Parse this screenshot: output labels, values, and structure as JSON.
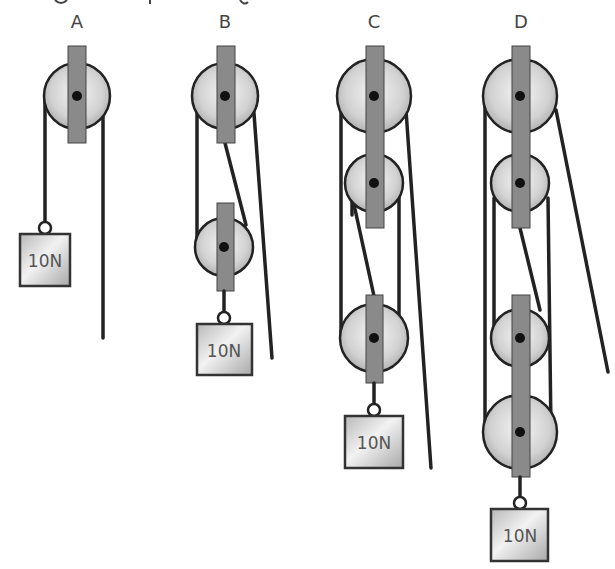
{
  "header": {
    "partial_text": "(cut-off title text at top edge)"
  },
  "systems": [
    {
      "id": "A",
      "label": "A",
      "pulleys": 1,
      "weight_label": "10N"
    },
    {
      "id": "B",
      "label": "B",
      "pulleys": 2,
      "weight_label": "10N"
    },
    {
      "id": "C",
      "label": "C",
      "pulleys": 3,
      "weight_label": "10N"
    },
    {
      "id": "D",
      "label": "D",
      "pulleys": 4,
      "weight_label": "10N"
    }
  ],
  "colors": {
    "rope": "#222222",
    "bar": "#8a8a8a",
    "wheel_light": "#f2f2f2",
    "wheel_dark": "#b5b5b5",
    "weight_light": "#f0f0f0",
    "weight_dark": "#b0b0b0"
  }
}
